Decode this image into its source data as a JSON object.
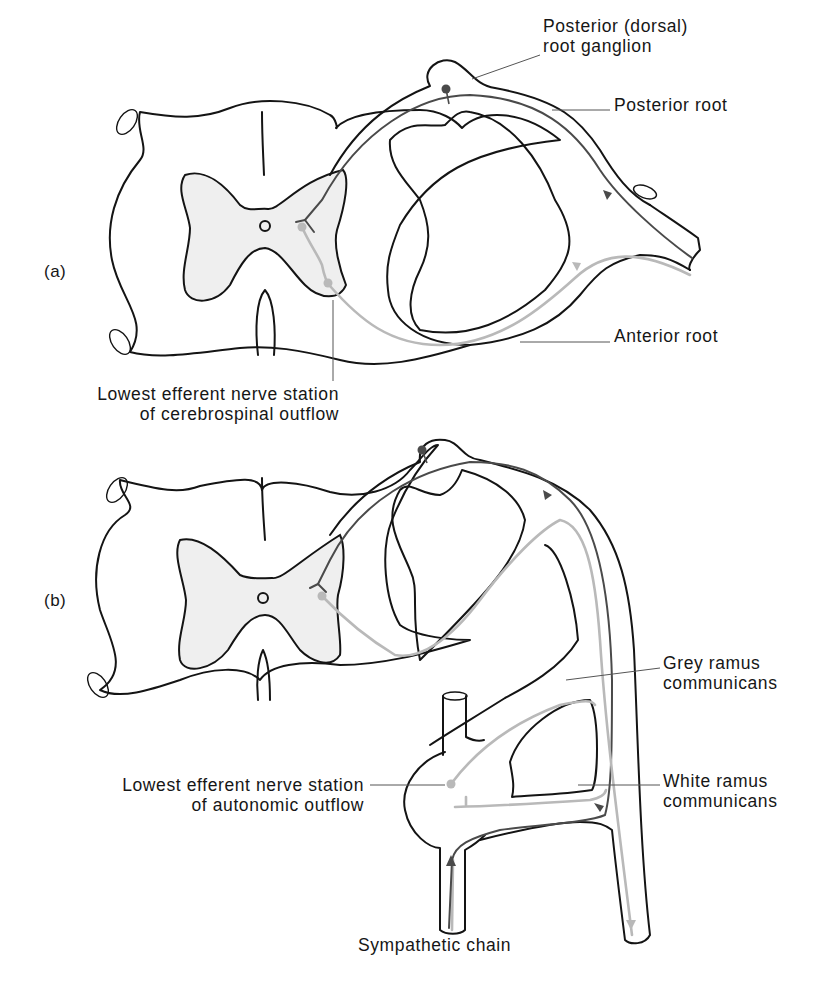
{
  "figure": {
    "panels": [
      {
        "id": "a",
        "tag": "(a)",
        "labels": {
          "ganglion_line1": "Posterior (dorsal)",
          "ganglion_line2": "root ganglion",
          "posterior_root": "Posterior root",
          "anterior_root": "Anterior root",
          "station_line1": "Lowest efferent nerve station",
          "station_line2": "of cerebrospinal outflow"
        }
      },
      {
        "id": "b",
        "tag": "(b)",
        "labels": {
          "grey_line1": "Grey ramus",
          "grey_line2": "communicans",
          "white_line1": "White ramus",
          "white_line2": "communicans",
          "station_line1": "Lowest efferent nerve station",
          "station_line2": "of autonomic outflow",
          "chain": "Sympathetic chain"
        }
      }
    ],
    "colors": {
      "outline": "#141414",
      "grey_matter": "#efefef",
      "afferent_pathway": "#4a4a4a",
      "efferent_pathway": "#b9b9b9"
    }
  }
}
